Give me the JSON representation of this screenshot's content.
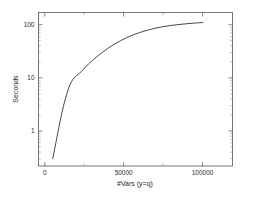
{
  "chart_data": {
    "type": "line",
    "title": "",
    "xlabel": "#Vars (y=q)",
    "ylabel": "Seconds",
    "xscale": "linear",
    "yscale": "log",
    "xlim": [
      -4000,
      119000
    ],
    "ylim": [
      0.22,
      170
    ],
    "grid": false,
    "legend": null,
    "xticks": [
      0,
      50000,
      100000
    ],
    "xtick_labels": [
      "0",
      "50000",
      "100000"
    ],
    "xticks_minor": [
      25000,
      75000
    ],
    "yticks": [
      1,
      10,
      100
    ],
    "ytick_labels": [
      "1",
      "10",
      "100"
    ],
    "series": [
      {
        "name": "runtime",
        "x": [
          5000,
          6000,
          7000,
          8000,
          9000,
          10000,
          11000,
          12000,
          13000,
          14000,
          15000,
          16000,
          17000,
          18000,
          19000,
          20000,
          21000,
          22000,
          24000,
          26000,
          28000,
          30000,
          33000,
          36000,
          40000,
          44000,
          48000,
          52000,
          56000,
          60000,
          65000,
          70000,
          75000,
          80000,
          85000,
          90000,
          95000,
          98000,
          100000
        ],
        "y": [
          0.3,
          0.42,
          0.6,
          0.85,
          1.2,
          1.7,
          2.3,
          3.1,
          4.0,
          5.1,
          6.3,
          7.5,
          8.6,
          9.5,
          10.3,
          11.0,
          11.6,
          12.2,
          14.0,
          16.2,
          18.6,
          21.0,
          25.0,
          29.5,
          36.0,
          43.0,
          50.0,
          57.5,
          64.5,
          71.0,
          79.0,
          86.0,
          92.0,
          97.0,
          101.0,
          104.5,
          107.5,
          109.0,
          110.0
        ]
      }
    ]
  },
  "axis": {
    "ylabel_text": "Seconds",
    "xlabel_text": "#Vars (y=q)"
  }
}
